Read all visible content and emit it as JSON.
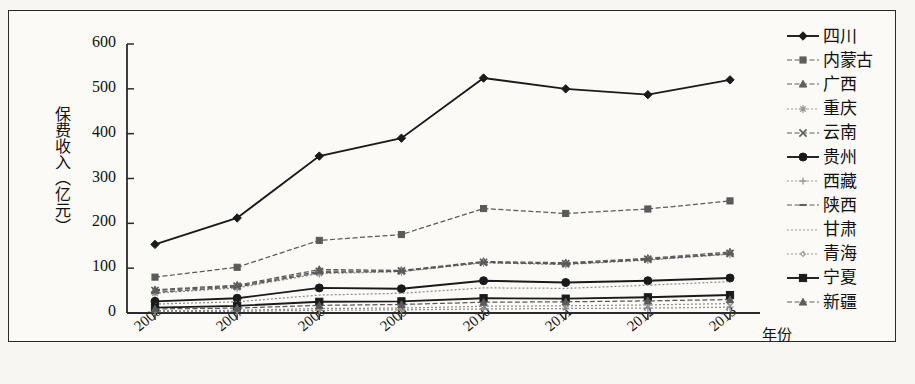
{
  "chart_data": {
    "type": "line",
    "title": "",
    "xlabel": "年份",
    "ylabel": "保费收入（亿元）",
    "categories": [
      "2006",
      "2007",
      "2008",
      "2009",
      "2010",
      "2011",
      "2012",
      "2013"
    ],
    "ylim": [
      0,
      600
    ],
    "yticks": [
      "0",
      "100",
      "200",
      "300",
      "400",
      "500",
      "600"
    ],
    "grid": false,
    "legend_position": "right",
    "series": [
      {
        "name": "四川",
        "marker": "diamond",
        "style": "solid",
        "values": [
          153,
          212,
          350,
          390,
          524,
          500,
          487,
          520
        ]
      },
      {
        "name": "内蒙古",
        "marker": "square",
        "style": "dashed",
        "values": [
          80,
          102,
          162,
          175,
          233,
          222,
          232,
          250
        ]
      },
      {
        "name": "广西",
        "marker": "triangle",
        "style": "dashed",
        "values": [
          52,
          62,
          97,
          95,
          115,
          112,
          122,
          136
        ]
      },
      {
        "name": "重庆",
        "marker": "star4",
        "style": "dotted",
        "values": [
          44,
          56,
          88,
          92,
          112,
          108,
          118,
          131
        ]
      },
      {
        "name": "云南",
        "marker": "cross",
        "style": "dashed",
        "values": [
          50,
          60,
          93,
          94,
          113,
          110,
          120,
          133
        ]
      },
      {
        "name": "贵州",
        "marker": "circle",
        "style": "solid",
        "values": [
          26,
          33,
          56,
          54,
          72,
          68,
          72,
          78
        ]
      },
      {
        "name": "西藏",
        "marker": "plus",
        "style": "dotted",
        "values": [
          3,
          4,
          6,
          7,
          9,
          10,
          11,
          13
        ]
      },
      {
        "name": "陕西",
        "marker": "dash",
        "style": "dashed",
        "values": [
          46,
          58,
          90,
          93,
          113,
          109,
          119,
          132
        ]
      },
      {
        "name": "甘肃",
        "marker": "none",
        "style": "dotted",
        "values": [
          20,
          25,
          40,
          44,
          56,
          55,
          62,
          70
        ]
      },
      {
        "name": "青海",
        "marker": "smalldia",
        "style": "dotted",
        "values": [
          5,
          6,
          10,
          11,
          15,
          16,
          18,
          21
        ]
      },
      {
        "name": "宁夏",
        "marker": "square",
        "style": "solid",
        "values": [
          12,
          16,
          25,
          26,
          33,
          32,
          35,
          40
        ]
      },
      {
        "name": "新疆",
        "marker": "triangle",
        "style": "dashed",
        "values": [
          9,
          11,
          17,
          19,
          24,
          25,
          27,
          30
        ]
      }
    ]
  },
  "legend": {
    "items": [
      {
        "label": "四川"
      },
      {
        "label": "内蒙古"
      },
      {
        "label": "广西"
      },
      {
        "label": "重庆"
      },
      {
        "label": "云南"
      },
      {
        "label": "贵州"
      },
      {
        "label": "西藏"
      },
      {
        "label": "陕西"
      },
      {
        "label": "甘肃"
      },
      {
        "label": "青海"
      },
      {
        "label": "宁夏"
      },
      {
        "label": "新疆"
      }
    ]
  }
}
